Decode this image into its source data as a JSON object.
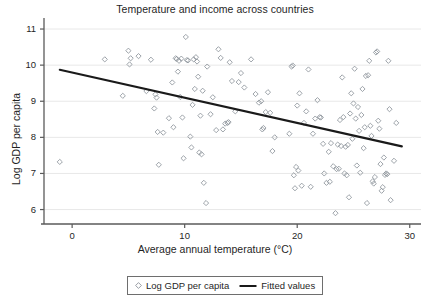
{
  "chart_data": {
    "type": "scatter",
    "title": "Temperature and income across countries",
    "xlabel": "Average annual temperature (°C)",
    "ylabel": "Log GDP per capita",
    "xlim": [
      -2.5,
      31.0
    ],
    "ylim": [
      5.6,
      11.25
    ],
    "xticks": [
      0,
      10,
      20,
      30
    ],
    "xtick_labels": [
      "0",
      "10",
      "20",
      "30"
    ],
    "yticks": [
      6,
      7,
      8,
      9,
      10,
      11
    ],
    "ytick_labels": [
      "6",
      "7",
      "8",
      "9",
      "10",
      "11"
    ],
    "grid": "horizontal",
    "grid_color": "#e8e8e8",
    "marker": "open-diamond",
    "marker_color": "#8d939b",
    "line_color": "#1a1a1a",
    "legend_position": "bottom-center",
    "series": [
      {
        "name": "Log GDP per capita",
        "type": "scatter",
        "points": [
          [
            -1.1,
            7.32
          ],
          [
            2.9,
            10.16
          ],
          [
            4.5,
            9.15
          ],
          [
            5.0,
            10.4
          ],
          [
            5.1,
            10.02
          ],
          [
            5.2,
            10.19
          ],
          [
            5.9,
            10.25
          ],
          [
            6.6,
            9.28
          ],
          [
            7.0,
            10.15
          ],
          [
            7.3,
            8.8
          ],
          [
            7.4,
            9.19
          ],
          [
            7.5,
            9.1
          ],
          [
            7.6,
            8.15
          ],
          [
            7.7,
            7.24
          ],
          [
            8.1,
            8.13
          ],
          [
            8.6,
            8.53
          ],
          [
            8.9,
            9.52
          ],
          [
            9.0,
            8.28
          ],
          [
            9.2,
            10.19
          ],
          [
            9.3,
            10.17
          ],
          [
            9.4,
            9.82
          ],
          [
            9.5,
            10.12
          ],
          [
            9.6,
            9.12
          ],
          [
            9.7,
            10.18
          ],
          [
            9.8,
            8.55
          ],
          [
            9.9,
            7.42
          ],
          [
            10.1,
            10.78
          ],
          [
            10.2,
            10.14
          ],
          [
            10.3,
            10.13
          ],
          [
            10.5,
            8.02
          ],
          [
            10.6,
            7.72
          ],
          [
            10.7,
            8.9
          ],
          [
            10.8,
            10.16
          ],
          [
            10.9,
            9.34
          ],
          [
            11.0,
            10.22
          ],
          [
            11.1,
            10.1
          ],
          [
            11.2,
            9.68
          ],
          [
            11.3,
            7.58
          ],
          [
            11.4,
            8.6
          ],
          [
            11.5,
            7.53
          ],
          [
            11.6,
            9.29
          ],
          [
            11.7,
            6.74
          ],
          [
            11.9,
            6.18
          ],
          [
            12.0,
            9.96
          ],
          [
            12.3,
            8.64
          ],
          [
            12.5,
            9.11
          ],
          [
            12.8,
            8.2
          ],
          [
            13.0,
            10.44
          ],
          [
            13.2,
            10.2
          ],
          [
            13.4,
            8.22
          ],
          [
            13.6,
            8.38
          ],
          [
            13.8,
            8.4
          ],
          [
            13.9,
            8.42
          ],
          [
            14.0,
            10.08
          ],
          [
            14.2,
            9.56
          ],
          [
            14.5,
            8.72
          ],
          [
            14.8,
            9.53
          ],
          [
            15.0,
            9.78
          ],
          [
            15.3,
            9.38
          ],
          [
            15.9,
            10.16
          ],
          [
            16.3,
            9.2
          ],
          [
            16.6,
            8.96
          ],
          [
            16.8,
            9.0
          ],
          [
            16.9,
            8.22
          ],
          [
            17.0,
            8.26
          ],
          [
            17.2,
            8.7
          ],
          [
            17.4,
            9.25
          ],
          [
            17.6,
            8.68
          ],
          [
            17.8,
            7.62
          ],
          [
            18.0,
            8.0
          ],
          [
            19.3,
            8.1
          ],
          [
            19.5,
            9.96
          ],
          [
            19.6,
            9.99
          ],
          [
            19.7,
            6.95
          ],
          [
            19.8,
            6.59
          ],
          [
            19.9,
            7.18
          ],
          [
            20.0,
            8.88
          ],
          [
            20.1,
            7.08
          ],
          [
            20.2,
            9.22
          ],
          [
            20.4,
            6.66
          ],
          [
            20.6,
            8.4
          ],
          [
            20.8,
            8.72
          ],
          [
            21.0,
            9.88
          ],
          [
            21.2,
            6.63
          ],
          [
            21.4,
            8.1
          ],
          [
            21.6,
            8.52
          ],
          [
            21.8,
            9.03
          ],
          [
            22.0,
            8.56
          ],
          [
            22.1,
            8.55
          ],
          [
            22.3,
            7.82
          ],
          [
            22.4,
            7.0
          ],
          [
            22.6,
            6.74
          ],
          [
            22.8,
            7.6
          ],
          [
            22.9,
            6.77
          ],
          [
            23.0,
            7.84
          ],
          [
            23.2,
            7.2
          ],
          [
            23.4,
            5.9
          ],
          [
            23.5,
            7.12
          ],
          [
            23.6,
            7.8
          ],
          [
            23.7,
            7.13
          ],
          [
            23.8,
            8.48
          ],
          [
            23.9,
            7.76
          ],
          [
            24.0,
            9.66
          ],
          [
            24.1,
            8.56
          ],
          [
            24.2,
            7.0
          ],
          [
            24.3,
            7.74
          ],
          [
            24.4,
            6.95
          ],
          [
            24.5,
            7.79
          ],
          [
            24.6,
            6.34
          ],
          [
            24.7,
            8.66
          ],
          [
            24.8,
            9.22
          ],
          [
            24.9,
            7.96
          ],
          [
            25.0,
            8.94
          ],
          [
            25.1,
            9.9
          ],
          [
            25.2,
            8.52
          ],
          [
            25.3,
            7.22
          ],
          [
            25.4,
            8.84
          ],
          [
            25.5,
            8.18
          ],
          [
            25.6,
            7.02
          ],
          [
            25.7,
            8.62
          ],
          [
            25.8,
            9.34
          ],
          [
            25.9,
            7.7
          ],
          [
            26.0,
            8.28
          ],
          [
            26.1,
            9.7
          ],
          [
            26.2,
            6.18
          ],
          [
            26.3,
            9.72
          ],
          [
            26.4,
            10.12
          ],
          [
            26.5,
            8.32
          ],
          [
            26.6,
            8.04
          ],
          [
            26.7,
            6.78
          ],
          [
            26.8,
            6.72
          ],
          [
            26.9,
            6.9
          ],
          [
            27.0,
            10.35
          ],
          [
            27.1,
            10.38
          ],
          [
            27.2,
            8.46
          ],
          [
            27.3,
            8.24
          ],
          [
            27.4,
            7.26
          ],
          [
            27.5,
            6.52
          ],
          [
            27.6,
            6.62
          ],
          [
            27.7,
            7.44
          ],
          [
            27.8,
            6.96
          ],
          [
            27.9,
            7.0
          ],
          [
            28.0,
            6.98
          ],
          [
            28.1,
            10.12
          ],
          [
            28.2,
            8.78
          ],
          [
            28.3,
            6.26
          ],
          [
            28.6,
            7.35
          ],
          [
            28.8,
            8.4
          ]
        ]
      },
      {
        "name": "Fitted values",
        "type": "line",
        "points": [
          [
            -1.1,
            9.87
          ],
          [
            29.3,
            7.75
          ]
        ]
      }
    ],
    "legend": [
      {
        "label": "Log GDP per capita",
        "marker": "open-diamond"
      },
      {
        "label": "Fitted values",
        "marker": "line"
      }
    ]
  }
}
